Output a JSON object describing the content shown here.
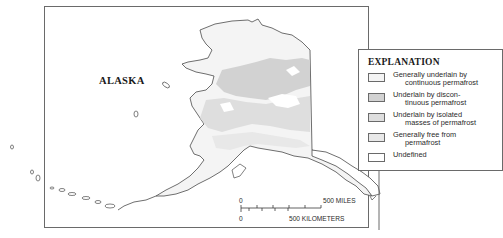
{
  "map": {
    "state_label": "ALASKA",
    "colors": {
      "continuous": "#f4f4f4",
      "discontinuous": "#d2d2d2",
      "isolated": "#dedede",
      "free": "#e8e8e8",
      "undefined": "#ffffff",
      "outline": "#4a4a4a"
    }
  },
  "legend": {
    "title": "EXPLANATION",
    "items": [
      {
        "line1": "Generally underlain by",
        "line2": "continuous permafrost",
        "color": "#f4f4f4"
      },
      {
        "line1": "Underlain by discon-",
        "line2": "tinuous permafrost",
        "color": "#d2d2d2"
      },
      {
        "line1": "Underlain by isolated",
        "line2": "masses of permafrost",
        "color": "#dedede"
      },
      {
        "line1": "Generally free from",
        "line2": "permafrost",
        "color": "#e8e8e8"
      },
      {
        "line1": "Undefined",
        "line2": "",
        "color": "#ffffff"
      }
    ]
  },
  "scale": {
    "miles_zero": "0",
    "miles_label": "500 MILES",
    "km_zero": "0",
    "km_label": "500 KILOMETERS"
  }
}
